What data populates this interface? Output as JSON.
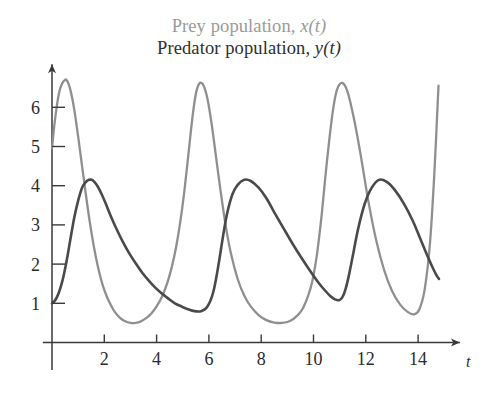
{
  "legend": {
    "prey": {
      "text": "Prey population, ",
      "variable": "x(t)",
      "color": "#9a9a9a"
    },
    "predator": {
      "text": "Predator population, ",
      "variable": "y(t)",
      "color": "#2e2e2e"
    }
  },
  "chart_data": {
    "type": "line",
    "title": "",
    "xlabel": "t",
    "ylabel": "",
    "xlim": [
      -0.35,
      15.6
    ],
    "ylim": [
      0,
      7.1
    ],
    "grid": false,
    "legend_position": "top-center",
    "xticks": [
      2,
      4,
      6,
      8,
      10,
      12,
      14
    ],
    "xtick_labels": [
      "2",
      "4",
      "6",
      "8",
      "10",
      "12",
      "14"
    ],
    "yticks": [
      1,
      2,
      3,
      4,
      5,
      6
    ],
    "ytick_labels": [
      "1",
      "2",
      "3",
      "4",
      "5",
      "6"
    ],
    "series": [
      {
        "name": "Prey population, x(t)",
        "color": "#8f8f8f",
        "width": 2.3,
        "x": [
          0.0,
          0.1,
          0.2,
          0.3,
          0.4,
          0.5,
          0.55,
          0.62,
          0.72,
          0.85,
          1.0,
          1.15,
          1.3,
          1.45,
          1.6,
          1.75,
          1.9,
          2.05,
          2.2,
          2.4,
          2.6,
          2.8,
          3.0,
          3.2,
          3.4,
          3.6,
          3.8,
          4.0,
          4.2,
          4.4,
          4.6,
          4.75,
          4.9,
          5.05,
          5.2,
          5.32,
          5.42,
          5.52,
          5.65,
          5.8,
          5.95,
          6.1,
          6.25,
          6.45,
          6.65,
          6.85,
          7.1,
          7.35,
          7.6,
          7.9,
          8.2,
          8.5,
          8.8,
          9.1,
          9.4,
          9.6,
          9.8,
          9.95,
          10.1,
          10.2,
          10.32,
          10.45,
          10.6,
          10.75,
          10.9,
          11.1,
          11.3,
          11.55,
          11.8,
          12.1,
          12.4,
          12.7,
          13.0,
          13.3,
          13.6,
          13.85,
          14.05,
          14.25,
          14.45,
          14.62,
          14.78
        ],
        "y": [
          4.95,
          5.6,
          6.1,
          6.45,
          6.62,
          6.7,
          6.7,
          6.62,
          6.4,
          5.95,
          5.25,
          4.5,
          3.75,
          3.05,
          2.45,
          1.95,
          1.55,
          1.25,
          1.02,
          0.78,
          0.63,
          0.54,
          0.5,
          0.5,
          0.54,
          0.62,
          0.74,
          0.92,
          1.16,
          1.5,
          1.98,
          2.45,
          3.05,
          3.8,
          4.7,
          5.45,
          6.0,
          6.4,
          6.62,
          6.55,
          6.2,
          5.6,
          4.85,
          3.85,
          2.95,
          2.25,
          1.62,
          1.2,
          0.92,
          0.7,
          0.57,
          0.51,
          0.5,
          0.55,
          0.7,
          0.88,
          1.2,
          1.55,
          2.1,
          2.6,
          3.3,
          4.2,
          5.15,
          5.95,
          6.45,
          6.62,
          6.4,
          5.7,
          4.8,
          3.6,
          2.6,
          1.85,
          1.32,
          0.98,
          0.78,
          0.72,
          0.85,
          1.35,
          2.5,
          4.3,
          6.55
        ]
      },
      {
        "name": "Predator population, y(t)",
        "color": "#4a4a4a",
        "width": 2.6,
        "x": [
          0.0,
          0.12,
          0.25,
          0.4,
          0.55,
          0.7,
          0.85,
          1.0,
          1.15,
          1.3,
          1.42,
          1.52,
          1.62,
          1.75,
          1.9,
          2.05,
          2.25,
          2.45,
          2.7,
          2.95,
          3.2,
          3.45,
          3.7,
          3.95,
          4.2,
          4.45,
          4.7,
          4.95,
          5.2,
          5.45,
          5.7,
          5.9,
          6.05,
          6.18,
          6.3,
          6.42,
          6.55,
          6.7,
          6.9,
          7.1,
          7.35,
          7.6,
          7.9,
          8.2,
          8.5,
          8.85,
          9.2,
          9.55,
          9.9,
          10.2,
          10.45,
          10.65,
          10.82,
          10.98,
          11.1,
          11.22,
          11.35,
          11.5,
          11.7,
          11.95,
          12.2,
          12.5,
          12.8,
          13.1,
          13.45,
          13.8,
          14.1,
          14.35,
          14.55,
          14.7,
          14.8
        ],
        "y": [
          1.0,
          1.08,
          1.25,
          1.58,
          2.05,
          2.62,
          3.18,
          3.62,
          3.95,
          4.1,
          4.15,
          4.15,
          4.1,
          3.98,
          3.78,
          3.55,
          3.22,
          2.92,
          2.58,
          2.28,
          2.02,
          1.78,
          1.58,
          1.4,
          1.25,
          1.12,
          1.0,
          0.92,
          0.85,
          0.8,
          0.8,
          0.88,
          1.05,
          1.32,
          1.72,
          2.2,
          2.75,
          3.3,
          3.78,
          4.02,
          4.15,
          4.12,
          3.95,
          3.68,
          3.32,
          2.92,
          2.52,
          2.15,
          1.8,
          1.52,
          1.32,
          1.18,
          1.1,
          1.08,
          1.15,
          1.35,
          1.7,
          2.2,
          2.88,
          3.52,
          3.92,
          4.15,
          4.1,
          3.9,
          3.55,
          3.1,
          2.62,
          2.22,
          1.92,
          1.72,
          1.62
        ]
      }
    ]
  }
}
